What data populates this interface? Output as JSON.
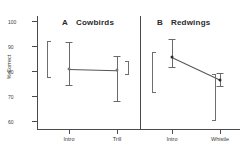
{
  "figure": {
    "y_axis_title": "% Correct"
  },
  "chart_data": {
    "type": "line",
    "title": "",
    "xlabel": "",
    "ylabel": "% Correct",
    "ylim": [
      57,
      102
    ],
    "yticks": [
      100,
      90,
      80,
      70,
      60
    ],
    "ytick_labels": [
      "100",
      "90",
      "80",
      "70",
      "60"
    ],
    "grid": false,
    "legend": "none",
    "panels": [
      {
        "letter": "A",
        "label": "Cowbirds",
        "categories": [
          "Intro",
          "Trill"
        ],
        "values": [
          81.0,
          80.5
        ],
        "error_low": [
          74.5,
          68.0
        ],
        "error_high": [
          91.5,
          86.0
        ],
        "brackets": [
          {
            "side": "left",
            "top_value": 92.0,
            "bottom_value": 77.5
          },
          {
            "side": "right",
            "top_value": 84.0,
            "bottom_value": 78.5
          }
        ]
      },
      {
        "letter": "B",
        "label": "Redwings",
        "categories": [
          "Intro",
          "Whistle"
        ],
        "values": [
          85.5,
          76.5
        ],
        "error_low": [
          81.5,
          74.0
        ],
        "error_high": [
          93.0,
          79.5
        ],
        "brackets": [
          {
            "side": "left",
            "top_value": 87.5,
            "bottom_value": 71.5
          },
          {
            "side": "right",
            "top_value": 79.0,
            "bottom_value": 60.0
          }
        ]
      }
    ]
  }
}
